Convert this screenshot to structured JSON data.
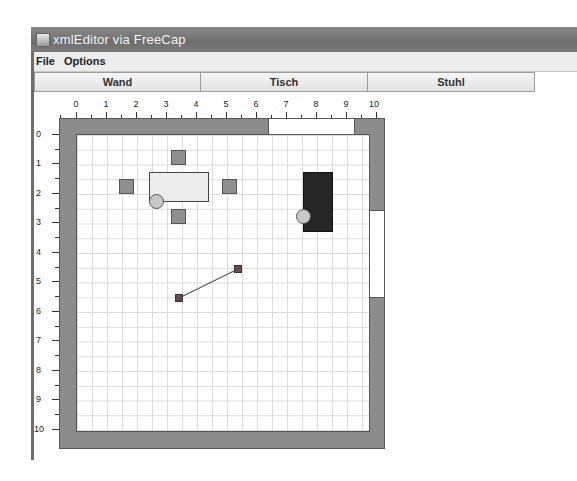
{
  "window": {
    "title": "xmlEditor via FreeCap",
    "app_icon": "java-app-icon"
  },
  "menubar": {
    "items": [
      {
        "label": "File"
      },
      {
        "label": "Options"
      }
    ]
  },
  "toolbar": {
    "buttons": [
      {
        "label": "Wand"
      },
      {
        "label": "Tisch"
      },
      {
        "label": "Stuhl"
      }
    ]
  },
  "canvas": {
    "ruler_x": [
      "0",
      "1",
      "2",
      "3",
      "4",
      "5",
      "6",
      "7",
      "8",
      "9",
      "10"
    ],
    "ruler_y": [
      "0",
      "1",
      "2",
      "3",
      "4",
      "5",
      "6",
      "7",
      "8",
      "9",
      "10"
    ],
    "grid_units": 10,
    "colors": {
      "wall": "#8c8c8c",
      "grid": "#dcdcdc",
      "table": "#ececec",
      "chair": "#8f8f8f",
      "dark_object": "#262626",
      "handle": "#c8c8c8",
      "node": "#6b4a4a"
    },
    "objects": {
      "top_opening": {
        "from_x": 6.5,
        "to_x": 9.5
      },
      "right_opening": {
        "from_y": 2.6,
        "to_y": 5.5
      },
      "table": {
        "x": 2.4,
        "y": 1.3,
        "w": 2.0,
        "h": 1.0
      },
      "chairs": [
        {
          "x": 3.2,
          "y": 0.55
        },
        {
          "x": 1.45,
          "y": 1.5
        },
        {
          "x": 4.85,
          "y": 1.5
        },
        {
          "x": 3.2,
          "y": 2.5
        }
      ],
      "dark_rect": {
        "x": 7.6,
        "y": 1.3,
        "w": 1.0,
        "h": 2.0
      },
      "wall_segment": {
        "x1": 3.45,
        "y1": 5.55,
        "x2": 5.4,
        "y2": 4.6
      }
    }
  }
}
